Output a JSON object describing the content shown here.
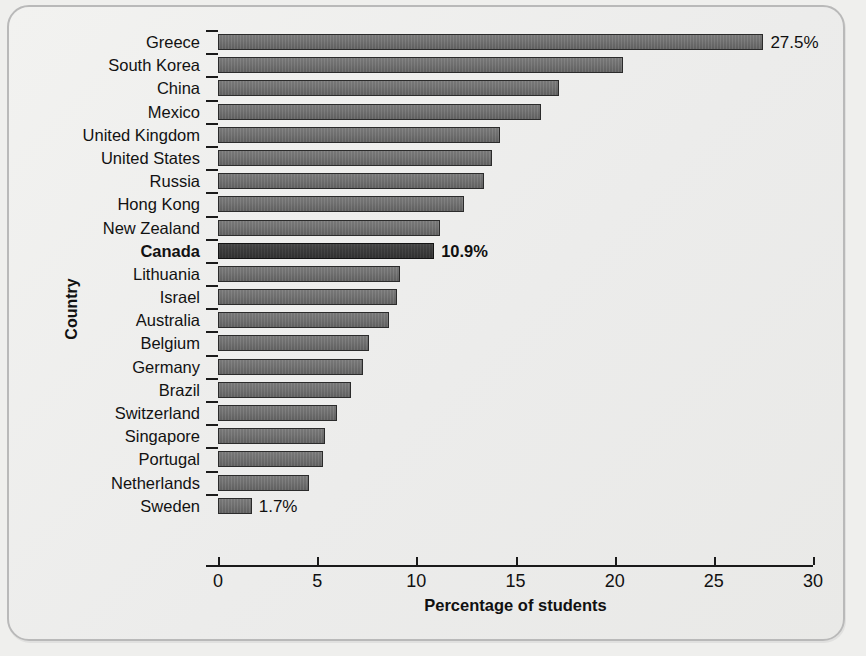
{
  "chart_data": {
    "type": "bar",
    "orientation": "horizontal",
    "title": "",
    "xlabel": "Percentage of students",
    "ylabel": "Country",
    "xlim": [
      0,
      30
    ],
    "xticks": [
      "0",
      "5",
      "10",
      "15",
      "20",
      "25",
      "30"
    ],
    "grid": false,
    "legend": null,
    "categories": [
      "Greece",
      "South Korea",
      "China",
      "Mexico",
      "United Kingdom",
      "United States",
      "Russia",
      "Hong Kong",
      "New Zealand",
      "Canada",
      "Lithuania",
      "Israel",
      "Australia",
      "Belgium",
      "Germany",
      "Brazil",
      "Switzerland",
      "Singapore",
      "Portugal",
      "Netherlands",
      "Sweden"
    ],
    "values": [
      27.5,
      20.4,
      17.2,
      16.3,
      14.2,
      13.8,
      13.4,
      12.4,
      11.2,
      10.9,
      9.2,
      9.0,
      8.6,
      7.6,
      7.3,
      6.7,
      6.0,
      5.4,
      5.3,
      4.6,
      1.7
    ],
    "data_labels": {
      "Greece": "27.5%",
      "Canada": "10.9%",
      "Sweden": "1.7%"
    },
    "highlighted": [
      "Canada"
    ],
    "colors": {
      "bar": "#6e6e6e",
      "bar_highlight": "#3a3a3a",
      "bar_border": "#2b2b2b",
      "axis": "#1a1a1a",
      "text": "#111111",
      "background": "#efefed",
      "frame_border": "#b9b9b9"
    }
  }
}
